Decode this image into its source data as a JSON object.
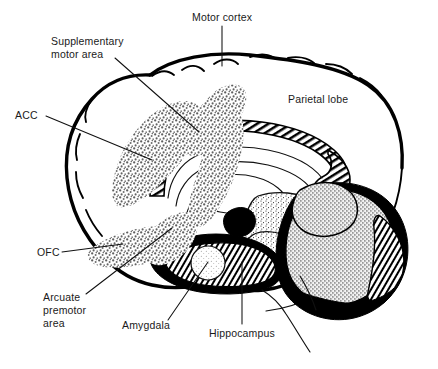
{
  "figure": {
    "background_color": "#ffffff",
    "ink_color": "#000000",
    "stipple_color": "#6e6e6e",
    "width": 438,
    "height": 369
  },
  "labels": [
    {
      "id": "motor-cortex",
      "text": "Motor cortex",
      "lines": [
        "Motor cortex"
      ],
      "x": 192,
      "y": 21,
      "anchor": "start",
      "leader": "vertical-down"
    },
    {
      "id": "supplementary-motor-area",
      "text": "Supplementary motor area",
      "lines": [
        "Supplementary",
        "motor area"
      ],
      "x": 51,
      "y": 45,
      "anchor": "start",
      "leader": "diagonal-down-right"
    },
    {
      "id": "acc",
      "text": "ACC",
      "lines": [
        "ACC"
      ],
      "x": 15,
      "y": 119,
      "anchor": "start",
      "leader": "diagonal-down-right"
    },
    {
      "id": "parietal-lobe",
      "text": "Parietal lobe",
      "lines": [
        "Parietal lobe"
      ],
      "x": 288,
      "y": 103,
      "anchor": "start",
      "leader": "none"
    },
    {
      "id": "ofc",
      "text": "OFC",
      "lines": [
        "OFC"
      ],
      "x": 37,
      "y": 256,
      "anchor": "start",
      "leader": "horizontal-right"
    },
    {
      "id": "arcuate-premotor-area",
      "text": "Arcuate premotor area",
      "lines": [
        "Arcuate",
        "premotor",
        "area"
      ],
      "x": 43,
      "y": 301,
      "anchor": "start",
      "leader": "diagonal-up-right"
    },
    {
      "id": "amygdala",
      "text": "Amygdala",
      "lines": [
        "Amygdala"
      ],
      "x": 122,
      "y": 329,
      "anchor": "start",
      "leader": "diagonal-up-right"
    },
    {
      "id": "hippocampus",
      "text": "Hippocampus",
      "lines": [
        "Hippocampus"
      ],
      "x": 209,
      "y": 337,
      "anchor": "start",
      "leader": "vertical-up"
    }
  ],
  "structures": [
    {
      "id": "cerebral-cortex-outline",
      "name": "Cerebral cortex outline",
      "texture": "heavy-black-gyral-band"
    },
    {
      "id": "corpus-callosum",
      "name": "Corpus callosum",
      "texture": "diagonal-hatch"
    },
    {
      "id": "fornix",
      "name": "Fornix",
      "texture": "outline"
    },
    {
      "id": "thalamus",
      "name": "Thalamus",
      "texture": "fine-stipple"
    },
    {
      "id": "brainstem",
      "name": "Brainstem",
      "texture": "fine-stipple"
    },
    {
      "id": "cerebellum",
      "name": "Cerebellum",
      "texture": "dense-cross-stipple"
    },
    {
      "id": "amygdala-body",
      "name": "Amygdala",
      "texture": "light-stipple"
    },
    {
      "id": "highlighted-regions",
      "name": "Highlighted cortical regions",
      "texture": "coarse-grey-stipple"
    }
  ]
}
